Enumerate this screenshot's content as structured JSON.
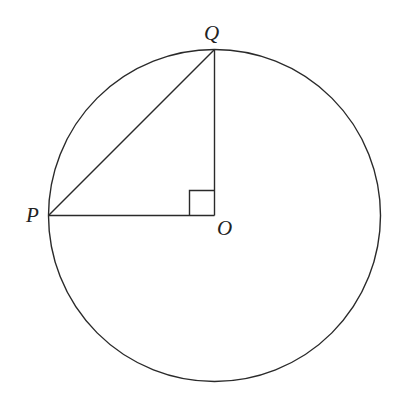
{
  "diagram": {
    "type": "geometry",
    "colors": {
      "stroke": "#2a2a2a",
      "background": "#ffffff",
      "text": "#222222"
    },
    "circle": {
      "center": "O",
      "cx": 214.5,
      "cy": 215.5,
      "r": 166
    },
    "points": {
      "P": {
        "label": "P",
        "x": 48.5,
        "y": 215.5
      },
      "Q": {
        "label": "Q",
        "x": 214.5,
        "y": 49.5
      },
      "O": {
        "label": "O",
        "x": 214.5,
        "y": 215.5
      }
    },
    "segments": [
      {
        "from": "P",
        "to": "Q"
      },
      {
        "from": "Q",
        "to": "O"
      },
      {
        "from": "P",
        "to": "O"
      }
    ],
    "right_angle_marker": {
      "at": "O",
      "size": 25
    }
  }
}
